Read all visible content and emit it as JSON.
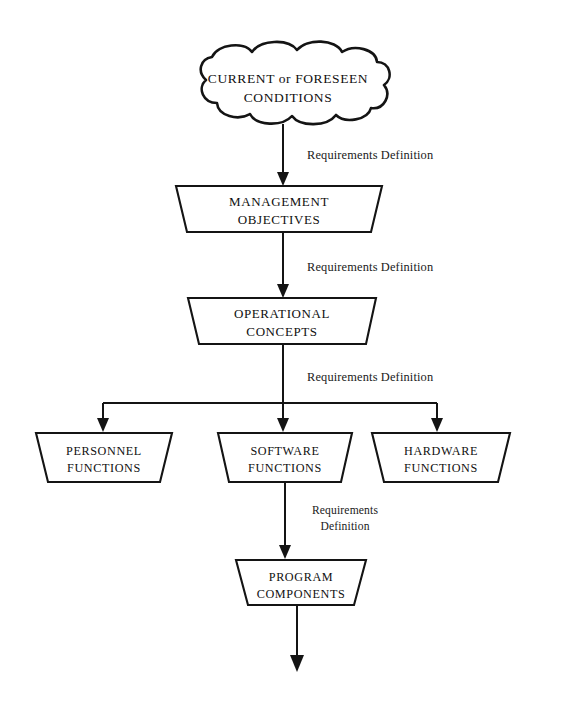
{
  "diagram": {
    "background_color": "#ffffff",
    "line_color": "#141414",
    "nodes": {
      "conditions": {
        "shape": "cloud",
        "line1": "CURRENT or FORESEEN",
        "line2": "CONDITIONS"
      },
      "management_objectives": {
        "shape": "trapezoid",
        "line1": "MANAGEMENT",
        "line2": "OBJECTIVES"
      },
      "operational_concepts": {
        "shape": "trapezoid",
        "line1": "OPERATIONAL",
        "line2": "CONCEPTS"
      },
      "personnel_functions": {
        "shape": "trapezoid",
        "line1": "PERSONNEL",
        "line2": "FUNCTIONS"
      },
      "software_functions": {
        "shape": "trapezoid",
        "line1": "SOFTWARE",
        "line2": "FUNCTIONS"
      },
      "hardware_functions": {
        "shape": "trapezoid",
        "line1": "HARDWARE",
        "line2": "FUNCTIONS"
      },
      "program_components": {
        "shape": "trapezoid",
        "line1": "PROGRAM",
        "line2": "COMPONENTS"
      }
    },
    "edge_labels": {
      "edge1": "Requirements Definition",
      "edge2": "Requirements Definition",
      "edge3": "Requirements Definition",
      "edge4_line1": "Requirements",
      "edge4_line2": "Definition"
    }
  }
}
